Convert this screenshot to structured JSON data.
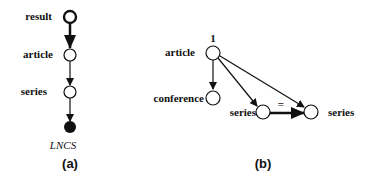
{
  "diagram_a": {
    "caption": "(a)",
    "nodes": [
      {
        "id": "result",
        "label": "result",
        "style": "bold-outline"
      },
      {
        "id": "article",
        "label": "article",
        "style": "open"
      },
      {
        "id": "series",
        "label": "series",
        "style": "open"
      },
      {
        "id": "lncs",
        "label": "LNCS",
        "style": "filled"
      }
    ],
    "edges": [
      {
        "from": "result",
        "to": "article",
        "style": "thick"
      },
      {
        "from": "article",
        "to": "series",
        "style": "normal"
      },
      {
        "from": "series",
        "to": "lncs",
        "style": "normal"
      }
    ]
  },
  "diagram_b": {
    "caption": "(b)",
    "root_annotation": "1",
    "equality_label": "=",
    "nodes": [
      {
        "id": "article",
        "label": "article"
      },
      {
        "id": "conference",
        "label": "conference"
      },
      {
        "id": "series1",
        "label": "series"
      },
      {
        "id": "series2",
        "label": "series"
      }
    ],
    "edges": [
      {
        "from": "article",
        "to": "conference",
        "style": "normal"
      },
      {
        "from": "article",
        "to": "series1",
        "style": "normal"
      },
      {
        "from": "article",
        "to": "series2",
        "style": "normal"
      },
      {
        "from": "series1",
        "to": "series2",
        "style": "thick",
        "label": "="
      }
    ]
  }
}
